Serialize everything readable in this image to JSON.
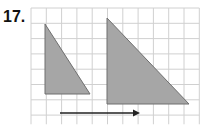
{
  "problem_number": "17.",
  "grid": {
    "x0": 31,
    "y0": 8,
    "cols": 11,
    "rows": 7.6,
    "cell": 15.3,
    "line_color": "#d0d0d0"
  },
  "shapes": {
    "preimage": {
      "label": "small-right-triangle",
      "points": "45,24 45,94 90,94",
      "fill": "#a6a6a6",
      "stroke": "#6f6f6f"
    },
    "image": {
      "label": "large-right-triangle",
      "points": "107,18 107,104 189,104",
      "fill": "#a6a6a6",
      "stroke": "#6f6f6f"
    }
  },
  "arrow": {
    "x1": 60,
    "y1": 113,
    "x2": 140,
    "y2": 113,
    "color": "#222222"
  }
}
